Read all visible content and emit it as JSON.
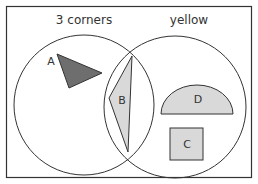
{
  "diagram": {
    "type": "venn",
    "sets": [
      {
        "label": "3 corners"
      },
      {
        "label": "yellow"
      }
    ],
    "shapes": [
      {
        "label": "A",
        "kind": "triangle",
        "region": "3 corners only",
        "fill": "#6e6e6e"
      },
      {
        "label": "B",
        "kind": "triangle",
        "region": "both",
        "fill": "#d9d9d9"
      },
      {
        "label": "C",
        "kind": "square",
        "region": "yellow only",
        "fill": "#d9d9d9"
      },
      {
        "label": "D",
        "kind": "semicircle",
        "region": "yellow only",
        "fill": "#d9d9d9"
      }
    ]
  },
  "colors": {
    "stroke": "#333333",
    "dark_fill": "#6e6e6e",
    "light_fill": "#d9d9d9"
  }
}
